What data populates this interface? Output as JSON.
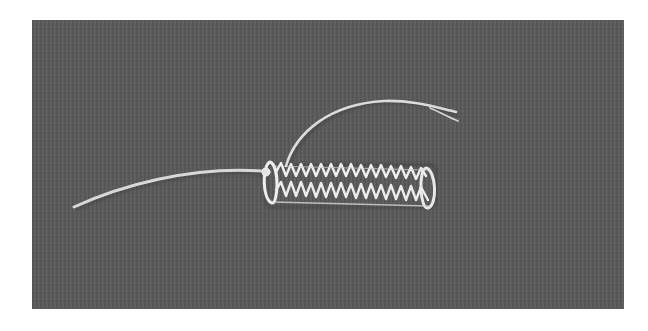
{
  "image": {
    "alt": "Grayscale photograph of a zigzag wire stent with two attached lead strands lying on a gray woven fabric background",
    "subject": "zigzag wire stent",
    "background": "gray textured fabric",
    "colors": {
      "page": "#ffffff",
      "fabric": "#5b5b5b",
      "fabric_dark": "#4e4e4e",
      "fabric_light": "#676767",
      "wire": "#e6e6e6",
      "wire_shadow": "#bcbcbc"
    }
  }
}
